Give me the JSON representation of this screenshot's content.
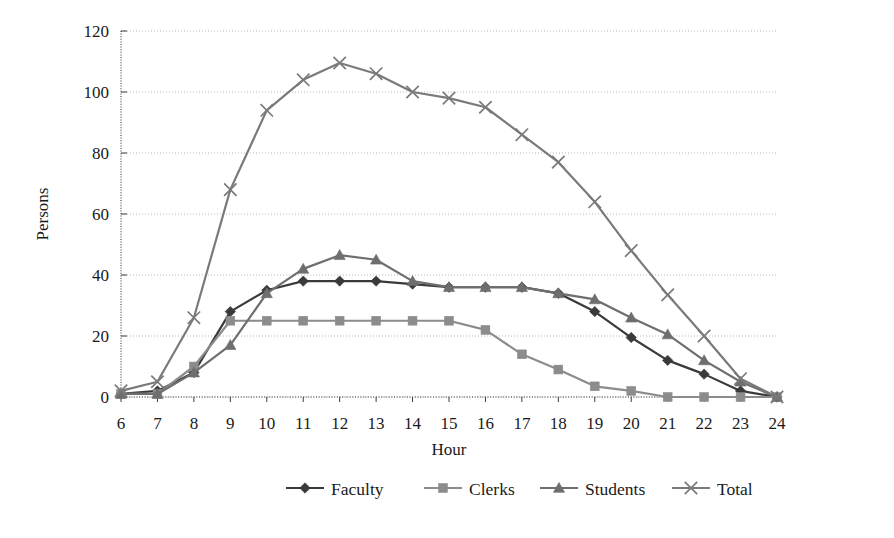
{
  "chart_data": {
    "type": "line",
    "title": "",
    "xlabel": "Hour",
    "ylabel": "Persons",
    "x": [
      6,
      7,
      8,
      9,
      10,
      11,
      12,
      13,
      14,
      15,
      16,
      17,
      18,
      19,
      20,
      21,
      22,
      23,
      24
    ],
    "categories": [
      "6",
      "7",
      "8",
      "9",
      "10",
      "11",
      "12",
      "13",
      "14",
      "15",
      "16",
      "17",
      "18",
      "19",
      "20",
      "21",
      "22",
      "23",
      "24"
    ],
    "xlim": [
      6,
      24
    ],
    "ylim": [
      0,
      120
    ],
    "yticks": [
      0,
      20,
      40,
      60,
      80,
      100,
      120
    ],
    "ytick_labels": [
      "0",
      "20",
      "40",
      "60",
      "80",
      "100",
      "120"
    ],
    "grid": true,
    "grid_style": "dotted-horizontal",
    "legend_position": "bottom",
    "series": [
      {
        "name": "Faculty",
        "marker": "diamond",
        "color": "#3a3a3a",
        "values": [
          1,
          2,
          8,
          28,
          35,
          38,
          38,
          38,
          37,
          36,
          36,
          36,
          34,
          28,
          19.5,
          12,
          7.5,
          2,
          0
        ]
      },
      {
        "name": "Clerks",
        "marker": "square",
        "color": "#8c8c8c",
        "values": [
          1,
          1,
          10,
          25,
          25,
          25,
          25,
          25,
          25,
          25,
          22,
          14,
          9,
          3.5,
          2,
          0,
          0,
          0,
          0
        ]
      },
      {
        "name": "Students",
        "marker": "triangle",
        "color": "#6e6e6e",
        "values": [
          1,
          1,
          8,
          17,
          34,
          42,
          46.5,
          45,
          38,
          36,
          36,
          36,
          34,
          32,
          26,
          20.5,
          12,
          5,
          0
        ]
      },
      {
        "name": "Total",
        "marker": "cross",
        "color": "#7a7a7a",
        "values": [
          2,
          5,
          26,
          68,
          94,
          104,
          109.5,
          106,
          100,
          98,
          95,
          86,
          77,
          64,
          48,
          33.5,
          20,
          6,
          0
        ]
      }
    ]
  },
  "legend": {
    "items": [
      {
        "label": "Faculty",
        "marker": "diamond",
        "color": "#3a3a3a"
      },
      {
        "label": "Clerks",
        "marker": "square",
        "color": "#8c8c8c"
      },
      {
        "label": "Students",
        "marker": "triangle",
        "color": "#6e6e6e"
      },
      {
        "label": "Total",
        "marker": "cross",
        "color": "#7a7a7a"
      }
    ]
  },
  "axes": {
    "x_title": "Hour",
    "y_title": "Persons"
  },
  "colors": {
    "background": "#ffffff",
    "axis": "#3c3c3c",
    "grid": "#b9b9b9",
    "text": "#1a1a1a"
  }
}
